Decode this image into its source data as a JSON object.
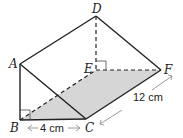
{
  "diagram": {
    "type": "triangular-prism",
    "vertices": {
      "A": {
        "label": "A",
        "x": 20,
        "y": 64
      },
      "B": {
        "label": "B",
        "x": 20,
        "y": 120
      },
      "C": {
        "label": "C",
        "x": 86,
        "y": 119
      },
      "D": {
        "label": "D",
        "x": 96,
        "y": 16
      },
      "E": {
        "label": "E",
        "x": 96,
        "y": 70
      },
      "F": {
        "label": "F",
        "x": 161,
        "y": 70
      }
    },
    "shaded_face": [
      "B",
      "C",
      "F",
      "E"
    ],
    "shade_color": "#d6d6d6",
    "line_color": "#222222",
    "dimension_color": "#9a9a9a",
    "dimensions": {
      "bc": "4 cm",
      "cf": "12 cm"
    },
    "right_angles": [
      "B",
      "E"
    ]
  }
}
